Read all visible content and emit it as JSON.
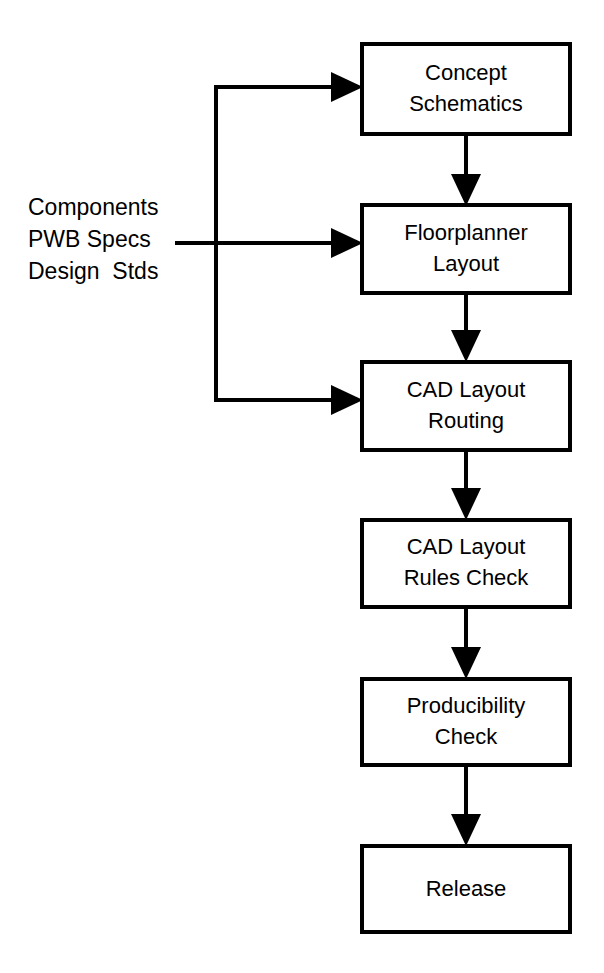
{
  "diagram": {
    "type": "flowchart",
    "background_color": "#ffffff",
    "line_color": "#000000",
    "box_fill": "#ffffff",
    "input_label": {
      "name": "design-inputs",
      "lines": [
        "Components",
        "PWB Specs",
        "Design  Stds"
      ]
    },
    "nodes": [
      {
        "id": "concept-schematics",
        "lines": [
          "Concept",
          "Schematics"
        ],
        "x": 362,
        "y": 44,
        "w": 208,
        "h": 90
      },
      {
        "id": "floorplanner-layout",
        "lines": [
          "Floorplanner",
          "Layout"
        ],
        "x": 362,
        "y": 205,
        "w": 208,
        "h": 88
      },
      {
        "id": "cad-layout-routing",
        "lines": [
          "CAD Layout",
          "Routing"
        ],
        "x": 362,
        "y": 362,
        "w": 208,
        "h": 88
      },
      {
        "id": "cad-layout-rules-check",
        "lines": [
          "CAD Layout",
          "Rules Check"
        ],
        "x": 362,
        "y": 520,
        "w": 208,
        "h": 87
      },
      {
        "id": "producibility-check",
        "lines": [
          "Producibility",
          "Check"
        ],
        "x": 362,
        "y": 679,
        "w": 208,
        "h": 86
      },
      {
        "id": "release",
        "lines": [
          "Release"
        ],
        "x": 362,
        "y": 846,
        "w": 208,
        "h": 86
      }
    ],
    "edges": [
      {
        "id": "edge-inputs-to-concept-schematics",
        "from": "design-inputs",
        "to": "concept-schematics",
        "direction": "right"
      },
      {
        "id": "edge-inputs-to-floorplanner-layout",
        "from": "design-inputs",
        "to": "floorplanner-layout",
        "direction": "right"
      },
      {
        "id": "edge-inputs-to-cad-layout-routing",
        "from": "design-inputs",
        "to": "cad-layout-routing",
        "direction": "right"
      },
      {
        "id": "edge-concept-schematics-to-floorplanner-layout",
        "from": "concept-schematics",
        "to": "floorplanner-layout",
        "direction": "down"
      },
      {
        "id": "edge-floorplanner-layout-to-cad-layout-routing",
        "from": "floorplanner-layout",
        "to": "cad-layout-routing",
        "direction": "down"
      },
      {
        "id": "edge-cad-layout-routing-to-cad-layout-rules-check",
        "from": "cad-layout-routing",
        "to": "cad-layout-rules-check",
        "direction": "down"
      },
      {
        "id": "edge-cad-layout-rules-check-to-producibility-check",
        "from": "cad-layout-rules-check",
        "to": "producibility-check",
        "direction": "down"
      },
      {
        "id": "edge-producibility-check-to-release",
        "from": "producibility-check",
        "to": "release",
        "direction": "down"
      }
    ]
  }
}
